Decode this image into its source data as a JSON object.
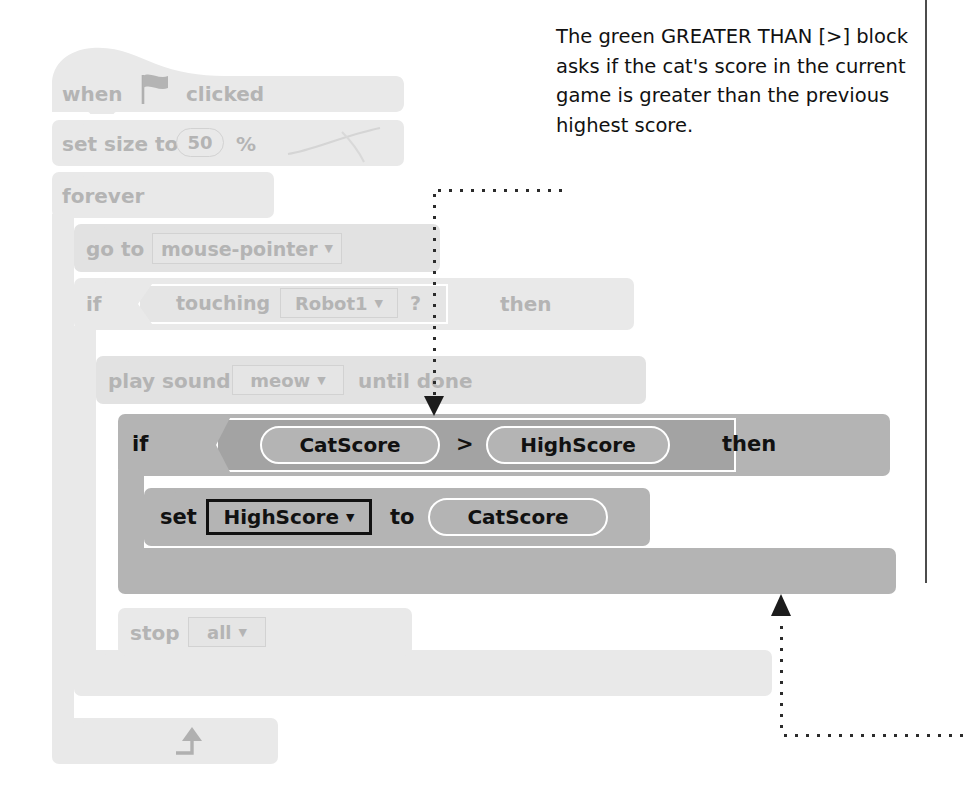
{
  "annotation": {
    "text": "The green GREATER THAN [>] block asks if the cat's score in the current game is greater than the previous highest score."
  },
  "script": {
    "title": "Scratch block script",
    "blocks": [
      {
        "id": "when-flag-clicked",
        "type": "hat",
        "state": "faded",
        "label_before": "when",
        "icon": "green-flag-icon",
        "label_after": "clicked"
      },
      {
        "id": "set-size-to",
        "type": "stack",
        "state": "faded",
        "label_before": "set size to",
        "value": "50",
        "label_after": "%"
      },
      {
        "id": "forever",
        "type": "c-block",
        "state": "faded",
        "label": "forever"
      },
      {
        "id": "go-to",
        "type": "stack",
        "state": "faded",
        "label_before": "go to",
        "dropdown": "mouse-pointer"
      },
      {
        "id": "if-touching",
        "type": "c-block",
        "state": "faded",
        "label_before": "if",
        "condition_label": "touching",
        "dropdown": "Robot1",
        "condition_suffix": "?",
        "label_after": "then"
      },
      {
        "id": "play-sound-until-done",
        "type": "stack",
        "state": "faded",
        "label_before": "play sound",
        "dropdown": "meow",
        "label_after": "until done"
      },
      {
        "id": "if-catscore-greater-highscore",
        "type": "c-block",
        "state": "highlighted",
        "label_before": "if",
        "operand_left": "CatScore",
        "operator": ">",
        "operand_right": "HighScore",
        "label_after": "then"
      },
      {
        "id": "set-highscore-to",
        "type": "stack",
        "state": "highlighted",
        "label_before": "set",
        "dropdown": "HighScore",
        "label_middle": "to",
        "reporter": "CatScore"
      },
      {
        "id": "stop-all",
        "type": "cap",
        "state": "faded",
        "label_before": "stop",
        "dropdown": "all"
      }
    ]
  },
  "labels": {
    "when": "when",
    "clicked": "clicked",
    "set_size_to": "set size to",
    "size_value": "50",
    "percent": "%",
    "forever": "forever",
    "go_to": "go to",
    "mouse_pointer": "mouse-pointer",
    "if": "if",
    "touching": "touching",
    "robot1": "Robot1",
    "question": "?",
    "then": "then",
    "play_sound": "play sound",
    "meow": "meow",
    "until_done": "until done",
    "catscore": "CatScore",
    "greater_than": ">",
    "highscore": "HighScore",
    "set": "set",
    "to": "to",
    "stop": "stop",
    "all": "all",
    "caret": "▼"
  },
  "colors": {
    "faded_fill": "#e9e9e9",
    "faded_fill_alt": "#e2e2e2",
    "faded_text": "#b4b4b4",
    "highlight_fill": "#b4b4b4",
    "highlight_fill_dark": "#a3a3a3",
    "highlight_text": "#111111",
    "callout_dot": "#2b2b2b",
    "rule": "#4c4c4c",
    "page_background": "#ffffff"
  },
  "callouts": [
    {
      "id": "callout-to-greater-than-block",
      "from": "annotation-text",
      "to": "if-catscore-greater-highscore",
      "arrow": "down"
    },
    {
      "id": "callout-to-if-block-end",
      "from": "page-right-edge",
      "to": "if-catscore-highscore-bottom",
      "arrow": "up"
    }
  ]
}
